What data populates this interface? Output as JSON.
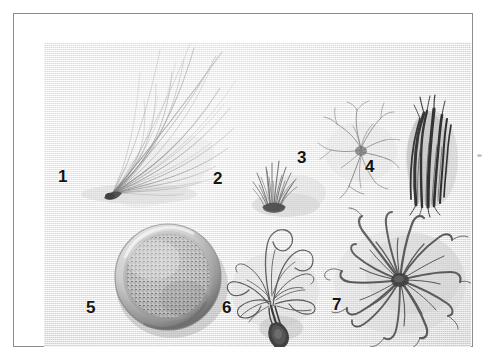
{
  "plate": {
    "title": "Botanical specimen plate",
    "caption": "Seven numbered plant material specimens on woven paper background",
    "frame_color": "#8d8d8d",
    "background_color": "#efefed",
    "label_color": "#141414",
    "ink_color": "#4a4a48"
  },
  "specimens": [
    {
      "id": 1,
      "label": "1",
      "name": "long-fibrous-tuft",
      "description": "Fan-shaped spray of long slender fibres radiating up and to the right from a dark basal node",
      "label_x": 62,
      "label_y": 170,
      "tone": "mid-grey"
    },
    {
      "id": 2,
      "label": "2",
      "name": "short-dense-tuft",
      "description": "Small dense brush-like tuft of short dark bristles",
      "label_x": 215,
      "label_y": 172,
      "tone": "dark-grey"
    },
    {
      "id": 3,
      "label": "3",
      "name": "sparse-wiry-strands",
      "description": "Loose open cluster of thin wiry branching strands",
      "label_x": 298,
      "label_y": 150,
      "tone": "light-grey"
    },
    {
      "id": 4,
      "label": "4",
      "name": "dark-stem-bundle",
      "description": "Compact vertical bundle of dark woody root or stem pieces",
      "label_x": 366,
      "label_y": 160,
      "tone": "near-black"
    },
    {
      "id": 5,
      "label": "5",
      "name": "powder-in-bowl",
      "description": "Round shallow bowl filled with coarse granular powder",
      "label_x": 88,
      "label_y": 300,
      "tone": "mid-grey"
    },
    {
      "id": 6,
      "label": "6",
      "name": "tangled-plant-with-bulb",
      "description": "Tangled curling stems with a small dark bulb or corm at the base",
      "label_x": 224,
      "label_y": 300,
      "tone": "dark-grey"
    },
    {
      "id": 7,
      "label": "7",
      "name": "leaf-rosette",
      "description": "Star-shaped rosette of long curving strap leaves radiating from a central crown",
      "label_x": 334,
      "label_y": 297,
      "tone": "mid-grey"
    }
  ],
  "marks": {
    "stray_speck": "faint speck outside right frame edge"
  }
}
